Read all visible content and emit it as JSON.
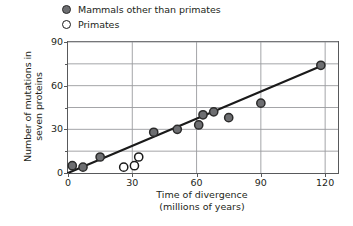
{
  "legend": {
    "items": [
      {
        "marker": "filled-circle-icon",
        "label": "Mammals other than primates"
      },
      {
        "marker": "open-circle-icon",
        "label": "Primates"
      }
    ]
  },
  "axes": {
    "y_label_line1": "Number of mutations in",
    "y_label_line2": "seven proteins",
    "x_label_line1": "Time of divergence",
    "x_label_line2": "(millions of years)"
  },
  "chart_data": {
    "type": "scatter",
    "title": "",
    "xlabel": "Time of divergence (millions of years)",
    "ylabel": "Number of mutations in seven proteins",
    "xlim": [
      0,
      126
    ],
    "ylim": [
      0,
      90
    ],
    "xticks": [
      0,
      30,
      60,
      90,
      120
    ],
    "yticks": [
      0,
      30,
      60,
      90
    ],
    "y_minor_ticks": [
      15,
      45,
      75
    ],
    "grid": "both",
    "legend_position": "above-plot-left",
    "series": [
      {
        "name": "Mammals other than primates",
        "marker": "filled-circle",
        "color": "#6d6e71",
        "edge_color": "#2b2b2b",
        "points": [
          {
            "x": 2,
            "y": 5
          },
          {
            "x": 7,
            "y": 4
          },
          {
            "x": 15,
            "y": 11
          },
          {
            "x": 40,
            "y": 28
          },
          {
            "x": 51,
            "y": 30
          },
          {
            "x": 61,
            "y": 33
          },
          {
            "x": 63,
            "y": 40
          },
          {
            "x": 68,
            "y": 42
          },
          {
            "x": 75,
            "y": 38
          },
          {
            "x": 90,
            "y": 48
          },
          {
            "x": 118,
            "y": 74
          }
        ]
      },
      {
        "name": "Primates",
        "marker": "open-circle",
        "color": "#ffffff",
        "edge_color": "#1a1a1a",
        "points": [
          {
            "x": 26,
            "y": 4
          },
          {
            "x": 31,
            "y": 5
          },
          {
            "x": 33,
            "y": 11
          }
        ]
      }
    ],
    "trend_line": {
      "type": "line",
      "color": "#1a1a1a",
      "x_start": 0,
      "y_start": 0,
      "x_end": 119,
      "y_end": 74
    }
  }
}
